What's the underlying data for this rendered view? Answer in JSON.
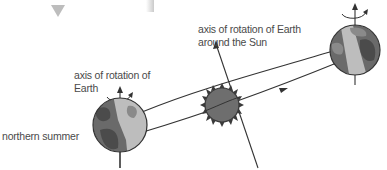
{
  "labels": {
    "sun_axis_line1": "axis of rotation of Earth",
    "sun_axis_line2": "around the Sun",
    "earth_axis_line1": "axis of rotation of",
    "earth_axis_line2": "Earth",
    "season": "northern summer"
  },
  "icons": {
    "top_marker": "down-triangle-icon",
    "sun": "sun-icon",
    "earth_left": "earth-globe-icon",
    "earth_right": "earth-globe-icon",
    "rotation": "rotation-arrow-icon"
  },
  "colors": {
    "line": "#333333",
    "sun_fill": "#6e6e6e",
    "sun_rays": "#3a3a3a",
    "earth_dark": "#6a6a6a",
    "earth_light": "#bdbdbd",
    "land_dark": "#4b4b4b",
    "land_light": "#8a8a8a",
    "triangle": "#bdbdbd",
    "text": "#4a4a4a"
  }
}
